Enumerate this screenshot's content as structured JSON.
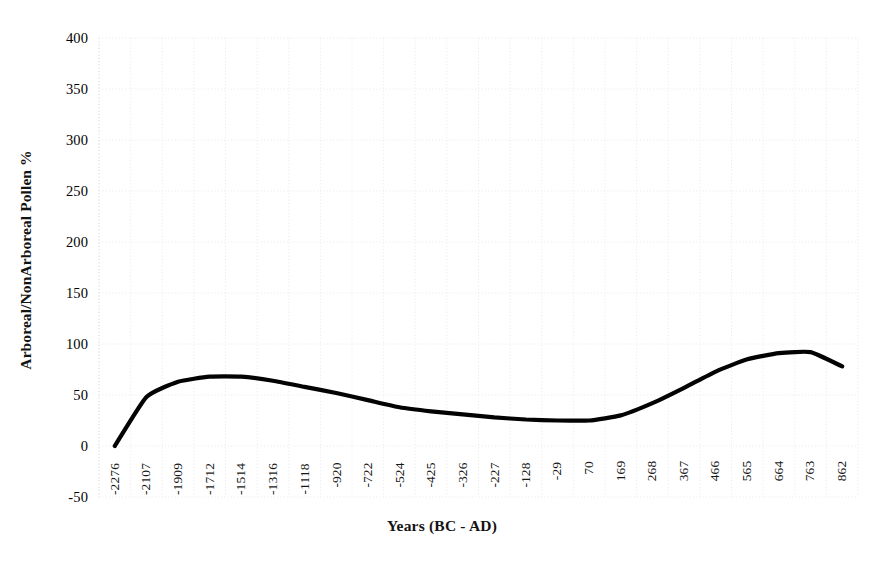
{
  "chart_data": {
    "type": "line",
    "title": "",
    "xlabel": "Years (BC - AD)",
    "ylabel": "Arboreal/NonArboreal Pollen %",
    "grid": true,
    "legend_position": "none",
    "ylim": [
      -50,
      400
    ],
    "yticks": [
      400,
      350,
      300,
      250,
      200,
      150,
      100,
      50,
      0,
      -50
    ],
    "ytick_labels": [
      "400",
      "350",
      "300",
      "250",
      "200",
      "150",
      "100",
      "50",
      "0",
      "-50"
    ],
    "categories": [
      "-2276",
      "-2107",
      "-1909",
      "-1712",
      "-1514",
      "-1316",
      "-1118",
      "-920",
      "-722",
      "-524",
      "-425",
      "-326",
      "-227",
      "-128",
      "-29",
      "70",
      "169",
      "268",
      "367",
      "466",
      "565",
      "664",
      "763",
      "862"
    ],
    "series": [
      {
        "name": "Arboreal/NonArboreal Pollen %",
        "color": "#000000",
        "values": [
          0,
          48,
          63,
          68,
          68,
          64,
          58,
          52,
          45,
          38,
          34,
          31,
          28,
          26,
          25,
          25,
          30,
          42,
          57,
          73,
          85,
          91,
          92,
          78
        ]
      }
    ]
  },
  "axes": {
    "y_title": "Arboreal/NonArboreal Pollen %",
    "x_title": "Years (BC - AD)"
  },
  "style": {
    "line_color": "#000000",
    "grid_color": "#e8e8e8",
    "background": "#ffffff"
  }
}
